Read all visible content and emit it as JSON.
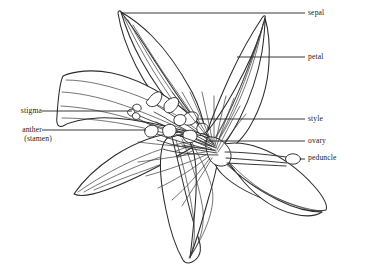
{
  "figure": {
    "background_color": "#ffffff",
    "line_color": "#2b2b2b",
    "text_color": "#1a1a1a"
  },
  "labels": {
    "sepal": "sepal",
    "petal": "petal",
    "style": "style",
    "ovary": "ovary",
    "peduncle": "peduncle",
    "stigma": "stigma",
    "anther": "anther",
    "stamen": "(stamen)"
  }
}
